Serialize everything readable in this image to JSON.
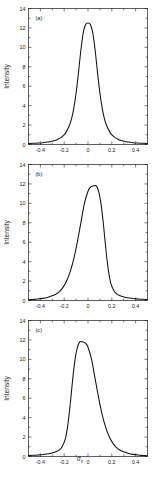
{
  "figure": {
    "x_axis_label": "σ",
    "x_axis_label_sub": "x",
    "y_axis_label": "Intensity"
  },
  "chart_data": [
    {
      "type": "line",
      "panel_label": "(a)",
      "title": "",
      "xlabel": "σ_x",
      "ylabel": "Intensity",
      "xlim": [
        -0.5,
        0.5
      ],
      "ylim": [
        0,
        14
      ],
      "xticks": [
        -0.4,
        -0.2,
        0,
        0.2,
        0.4
      ],
      "xticklabels": [
        "-0.4",
        "-0.2",
        "0",
        "0.2",
        "0.4"
      ],
      "yticks": [
        0,
        2,
        4,
        6,
        8,
        10,
        12,
        14
      ],
      "yticklabels": [
        "0",
        "2",
        "4",
        "6",
        "8",
        "10",
        "12",
        "14"
      ],
      "grid": false,
      "legend": "none",
      "peak_x": 0.0,
      "peak_y": 12.5,
      "series": [
        {
          "name": "intensity",
          "x": [
            -0.5,
            -0.46,
            -0.42,
            -0.38,
            -0.34,
            -0.3,
            -0.26,
            -0.22,
            -0.19,
            -0.16,
            -0.14,
            -0.12,
            -0.1,
            -0.08,
            -0.06,
            -0.04,
            -0.02,
            0.0,
            0.02,
            0.04,
            0.06,
            0.08,
            0.1,
            0.12,
            0.14,
            0.16,
            0.19,
            0.22,
            0.26,
            0.3,
            0.34,
            0.38,
            0.42,
            0.46,
            0.5
          ],
          "y": [
            0.1,
            0.12,
            0.15,
            0.19,
            0.25,
            0.34,
            0.49,
            0.78,
            1.15,
            1.85,
            2.55,
            3.7,
            5.3,
            7.4,
            9.7,
            11.5,
            12.35,
            12.5,
            12.35,
            11.5,
            9.7,
            7.4,
            5.3,
            3.7,
            2.55,
            1.85,
            1.15,
            0.78,
            0.49,
            0.34,
            0.25,
            0.19,
            0.15,
            0.12,
            0.1
          ]
        }
      ]
    },
    {
      "type": "line",
      "panel_label": "(b)",
      "title": "",
      "xlabel": "σ_x",
      "ylabel": "Intensity",
      "xlim": [
        -0.5,
        0.5
      ],
      "ylim": [
        0,
        14
      ],
      "xticks": [
        -0.4,
        -0.2,
        0,
        0.2,
        0.4
      ],
      "xticklabels": [
        "-0.4",
        "-0.2",
        "0",
        "0.2",
        "0.4"
      ],
      "yticks": [
        0,
        2,
        4,
        6,
        8,
        10,
        12,
        14
      ],
      "yticklabels": [
        "0",
        "2",
        "4",
        "6",
        "8",
        "10",
        "12",
        "14"
      ],
      "grid": false,
      "legend": "none",
      "peak_x": 0.07,
      "peak_y": 11.8,
      "series": [
        {
          "name": "intensity",
          "x": [
            -0.5,
            -0.46,
            -0.42,
            -0.38,
            -0.34,
            -0.3,
            -0.27,
            -0.24,
            -0.21,
            -0.18,
            -0.15,
            -0.12,
            -0.09,
            -0.06,
            -0.03,
            0.0,
            0.02,
            0.04,
            0.05,
            0.07,
            0.09,
            0.11,
            0.13,
            0.15,
            0.17,
            0.19,
            0.22,
            0.25,
            0.29,
            0.33,
            0.38,
            0.42,
            0.46,
            0.5
          ],
          "y": [
            0.08,
            0.11,
            0.15,
            0.22,
            0.32,
            0.48,
            0.65,
            0.92,
            1.35,
            2.0,
            2.95,
            4.25,
            6.0,
            8.0,
            10.0,
            11.25,
            11.65,
            11.8,
            11.8,
            11.8,
            11.2,
            9.9,
            7.8,
            5.3,
            3.2,
            1.85,
            0.95,
            0.6,
            0.4,
            0.28,
            0.2,
            0.16,
            0.13,
            0.11
          ]
        }
      ]
    },
    {
      "type": "line",
      "panel_label": "(c)",
      "title": "",
      "xlabel": "σ_x",
      "ylabel": "Intensity",
      "xlim": [
        -0.5,
        0.5
      ],
      "ylim": [
        0,
        14
      ],
      "xticks": [
        -0.4,
        -0.2,
        0,
        0.2,
        0.4
      ],
      "xticklabels": [
        "-0.4",
        "-0.2",
        "0",
        "0.2",
        "0.4"
      ],
      "yticks": [
        0,
        2,
        4,
        6,
        8,
        10,
        12,
        14
      ],
      "yticklabels": [
        "0",
        "2",
        "4",
        "6",
        "8",
        "10",
        "12",
        "14"
      ],
      "grid": false,
      "legend": "none",
      "peak_x": -0.07,
      "peak_y": 11.8,
      "series": [
        {
          "name": "intensity",
          "x": [
            -0.5,
            -0.46,
            -0.42,
            -0.38,
            -0.33,
            -0.29,
            -0.25,
            -0.22,
            -0.19,
            -0.17,
            -0.15,
            -0.13,
            -0.11,
            -0.09,
            -0.07,
            -0.05,
            -0.04,
            -0.02,
            0.0,
            0.03,
            0.06,
            0.09,
            0.12,
            0.15,
            0.18,
            0.21,
            0.24,
            0.27,
            0.3,
            0.34,
            0.38,
            0.42,
            0.46,
            0.5
          ],
          "y": [
            0.11,
            0.13,
            0.16,
            0.2,
            0.28,
            0.4,
            0.6,
            0.95,
            1.85,
            3.2,
            5.3,
            7.8,
            9.9,
            11.2,
            11.8,
            11.8,
            11.8,
            11.65,
            11.25,
            10.0,
            8.0,
            6.0,
            4.25,
            2.95,
            2.0,
            1.35,
            0.92,
            0.65,
            0.48,
            0.32,
            0.22,
            0.15,
            0.11,
            0.08
          ]
        }
      ]
    }
  ]
}
